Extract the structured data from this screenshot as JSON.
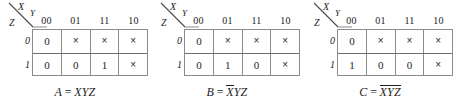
{
  "figure": {
    "type": "karnaugh-map-set",
    "map_count": 3,
    "row_variable": "Z",
    "col_variables": "XY",
    "corner_labels": {
      "top": "X",
      "right": "Y",
      "bottom": "Z"
    },
    "column_headers": [
      "00",
      "01",
      "11",
      "10"
    ],
    "row_headers": [
      "0",
      "1"
    ],
    "dont_care_symbol": "×"
  },
  "maps": [
    {
      "id": "map-a",
      "caption": {
        "output": "A",
        "equals": "=",
        "expression": "XYZ",
        "overbar_span": "none",
        "full_text": "A = XYZ"
      },
      "rows": [
        {
          "label": "0",
          "cells": [
            "0",
            "×",
            "×",
            "×"
          ]
        },
        {
          "label": "1",
          "cells": [
            "0",
            "0",
            "1",
            "×"
          ]
        }
      ]
    },
    {
      "id": "map-b",
      "caption": {
        "output": "B",
        "equals": "=",
        "expression": "XYZ",
        "overbar_span": "X",
        "overbar_text": "X",
        "plain_text": "YZ",
        "full_text": "B = XYZ"
      },
      "rows": [
        {
          "label": "0",
          "cells": [
            "0",
            "×",
            "×",
            "×"
          ]
        },
        {
          "label": "1",
          "cells": [
            "0",
            "1",
            "0",
            "×"
          ]
        }
      ]
    },
    {
      "id": "map-c",
      "caption": {
        "output": "C",
        "equals": "=",
        "expression": "XYZ",
        "overbar_span": "XYZ",
        "overbar_text": "XYZ",
        "plain_text": "",
        "full_text": "C = XYZ"
      },
      "rows": [
        {
          "label": "0",
          "cells": [
            "0",
            "×",
            "×",
            "×"
          ]
        },
        {
          "label": "1",
          "cells": [
            "1",
            "0",
            "0",
            "×"
          ]
        }
      ]
    }
  ],
  "colors": {
    "background": "#ffffff",
    "grid_line": "#8c8c8c",
    "grid_line_strong": "#6e6e6e",
    "text": "#1c1c1c"
  }
}
